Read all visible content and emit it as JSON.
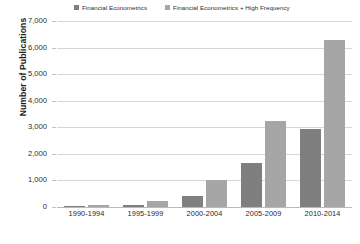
{
  "chart_data": {
    "type": "bar",
    "title": "",
    "subtitle": "",
    "xlabel": "",
    "ylabel": "Number of Publications",
    "categories": [
      "1990-1994",
      "1995-1999",
      "2000-2004",
      "2005-2009",
      "2010-2014"
    ],
    "series": [
      {
        "name": "Financial Econometrics",
        "color": "#7f7f7f",
        "values": [
          30,
          90,
          430,
          1650,
          2950
        ]
      },
      {
        "name": "Financial Econometrics + High Frequency",
        "color": "#a6a6a6",
        "values": [
          60,
          240,
          1000,
          3250,
          6300
        ]
      }
    ],
    "ylim": [
      0,
      7000
    ],
    "ytick_values": [
      7000,
      6000,
      5000,
      4000,
      3000,
      2000,
      1000,
      0
    ],
    "ytick_labels": [
      "7,000",
      "6,000",
      "5,000",
      "4,000",
      "3,000",
      "2,000",
      "1,000",
      "0"
    ],
    "grid": true,
    "gridline_color": "#d7d7d7",
    "legend_position": "top",
    "background_color": "#ffffff",
    "bar_group_order": [
      "Financial Econometrics",
      "Financial Econometrics + High Frequency"
    ]
  }
}
